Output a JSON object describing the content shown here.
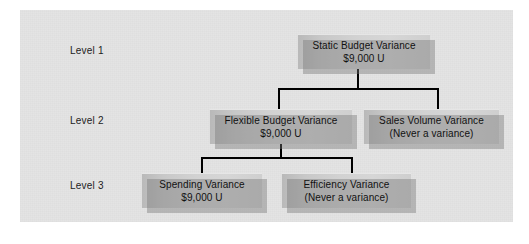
{
  "diagram": {
    "panel_color": "#e4e4e4",
    "box_color": "#d2d2d2",
    "line_color": "#000000",
    "text_color": "#111111",
    "levels": [
      {
        "label": "Level 1"
      },
      {
        "label": "Level 2"
      },
      {
        "label": "Level 3"
      }
    ],
    "nodes": [
      {
        "id": "static-budget-variance",
        "level": 1,
        "line1": "Static Budget Variance",
        "line2": "$9,000 U"
      },
      {
        "id": "flexible-budget-variance",
        "level": 2,
        "line1": "Flexible Budget Variance",
        "line2": "$9,000 U"
      },
      {
        "id": "sales-volume-variance",
        "level": 2,
        "line1": "Sales Volume Variance",
        "line2": "(Never a variance)"
      },
      {
        "id": "spending-variance",
        "level": 3,
        "line1": "Spending Variance",
        "line2": "$9,000 U"
      },
      {
        "id": "efficiency-variance",
        "level": 3,
        "line1": "Efficiency Variance",
        "line2": "(Never a variance)"
      }
    ]
  }
}
